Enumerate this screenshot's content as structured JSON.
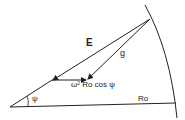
{
  "diagram": {
    "labels": {
      "E": "E",
      "g": "g",
      "centrifugal": "ω² Ro cos ψ",
      "angle": "ψ",
      "radius": "Ro"
    },
    "colors": {
      "stroke": "#222222",
      "background": "#ffffff"
    }
  }
}
